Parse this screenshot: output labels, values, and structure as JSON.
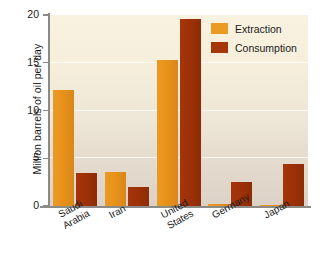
{
  "chart_data": {
    "type": "bar",
    "title": "",
    "xlabel": "",
    "ylabel": "Million barrels of oil per day",
    "ylim": [
      0,
      20
    ],
    "yticks": [
      0,
      5,
      10,
      15,
      20
    ],
    "ytick_labels": [
      "0",
      "5",
      "10",
      "15",
      "20"
    ],
    "grid": true,
    "legend_position": "top-right",
    "categories": [
      "Saudi Arabia",
      "Iran",
      "United States",
      "Germany",
      "Japan"
    ],
    "category_lines": [
      [
        "Saudi",
        "Arabia"
      ],
      [
        "Iran"
      ],
      [
        "United",
        "States"
      ],
      [
        "Germany"
      ],
      [
        "Japan"
      ]
    ],
    "series": [
      {
        "name": "Extraction",
        "color": "#E8951F",
        "values": [
          12.2,
          3.6,
          15.3,
          0.25,
          0.12
        ]
      },
      {
        "name": "Consumption",
        "color": "#A33208",
        "values": [
          3.45,
          1.95,
          19.6,
          2.5,
          4.35
        ]
      }
    ]
  },
  "legend": {
    "items": [
      {
        "label": "Extraction",
        "swatch": "extraction"
      },
      {
        "label": "Consumption",
        "swatch": "consumption"
      }
    ]
  }
}
